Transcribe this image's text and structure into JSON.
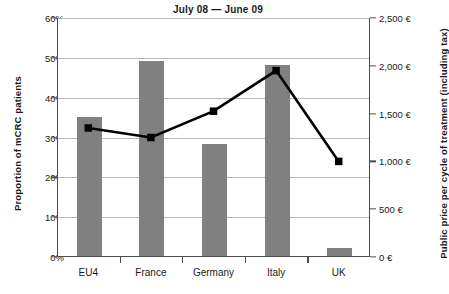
{
  "chart_data": {
    "type": "bar",
    "title": "July 08 — June 09",
    "subtitle": "",
    "categories": [
      "EU4",
      "France",
      "Germany",
      "Italy",
      "UK"
    ],
    "xlabel": "",
    "ylabel": "Proportion of mCRC patients",
    "ylabel_secondary": "Public price per cycle of treatment (including tax)",
    "ylim": [
      0,
      0.6
    ],
    "ylim_secondary": [
      0,
      2500
    ],
    "grid": true,
    "legend": "none",
    "series": [
      {
        "name": "Proportion of mCRC patients",
        "type": "bar",
        "axis": "left",
        "color": "#808080",
        "values": [
          0.35,
          0.49,
          0.28,
          0.48,
          0.02
        ]
      },
      {
        "name": "Public price per cycle of treatment (including tax)",
        "type": "line",
        "axis": "right",
        "color": "#000000",
        "marker": "square",
        "values": [
          1350,
          1250,
          1525,
          1950,
          1000
        ]
      }
    ],
    "yticks_left": [
      "0%",
      "10%",
      "20%",
      "30%",
      "40%",
      "50%",
      "60%"
    ],
    "yticks_left_values": [
      0,
      0.1,
      0.2,
      0.3,
      0.4,
      0.5,
      0.6
    ],
    "yticks_right": [
      "0 €",
      "500 €",
      "1,000 €",
      "1,500 €",
      "2,000 €",
      "2,500 €"
    ],
    "yticks_right_values": [
      0,
      500,
      1000,
      1500,
      2000,
      2500
    ]
  },
  "colors": {
    "bar": "#808080",
    "line": "#000000",
    "grid": "#b8b8b8",
    "axis": "#4d4d4d",
    "text": "#1a1a1a",
    "background": "#ffffff"
  }
}
